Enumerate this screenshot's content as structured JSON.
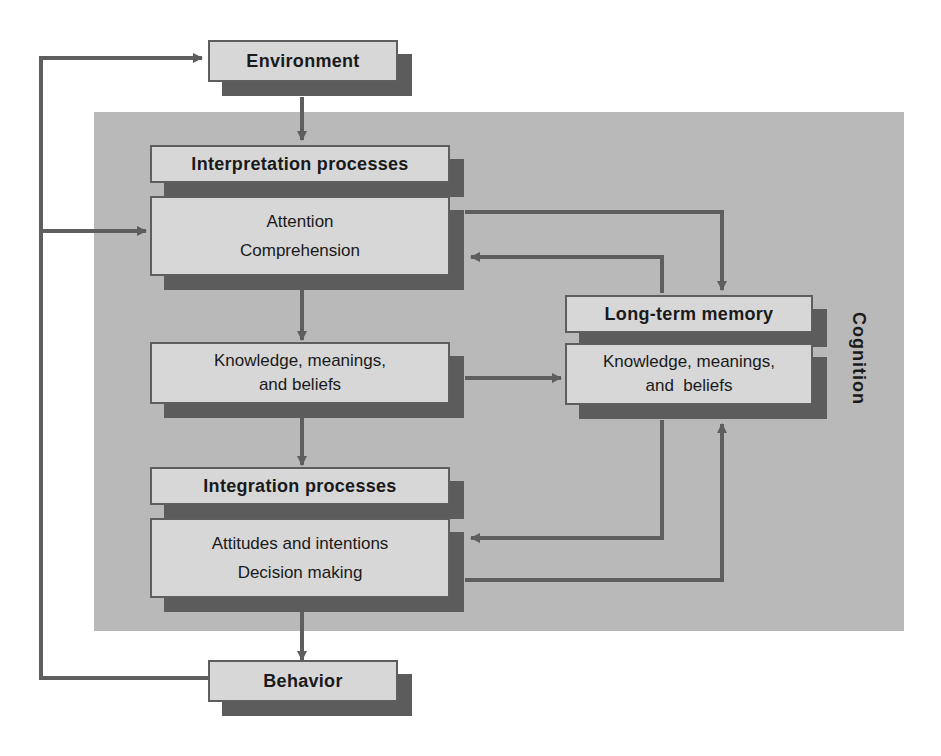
{
  "diagram": {
    "region_label": "Cognition",
    "colors": {
      "panel": "#b9b9b9",
      "box_face": "#d7d7d7",
      "box_shadow": "#5c5c5c",
      "arrow": "#5e5e5e",
      "text": "#1a1a1a"
    },
    "nodes": {
      "environment": {
        "label": "Environment"
      },
      "interpretation": {
        "header": "Interpretation processes",
        "items": [
          "Attention",
          "Comprehension"
        ]
      },
      "knowledge_mid": {
        "line1": "Knowledge, meanings,",
        "line2": "and beliefs"
      },
      "long_term_memory": {
        "header": "Long-term memory",
        "line1": "Knowledge, meanings,",
        "line2": "and  beliefs"
      },
      "integration": {
        "header": "Integration processes",
        "items": [
          "Attitudes and intentions",
          "Decision making"
        ]
      },
      "behavior": {
        "label": "Behavior"
      }
    },
    "edges": [
      {
        "from": "environment",
        "to": "interpretation"
      },
      {
        "from": "interpretation",
        "to": "knowledge_mid"
      },
      {
        "from": "knowledge_mid",
        "to": "integration"
      },
      {
        "from": "integration",
        "to": "behavior"
      },
      {
        "from": "behavior",
        "to": "environment"
      },
      {
        "from": "behavior",
        "to": "interpretation"
      },
      {
        "from": "interpretation",
        "to": "long_term_memory"
      },
      {
        "from": "long_term_memory",
        "to": "interpretation"
      },
      {
        "from": "knowledge_mid",
        "to": "long_term_memory"
      },
      {
        "from": "long_term_memory",
        "to": "integration"
      },
      {
        "from": "integration",
        "to": "long_term_memory"
      }
    ]
  }
}
